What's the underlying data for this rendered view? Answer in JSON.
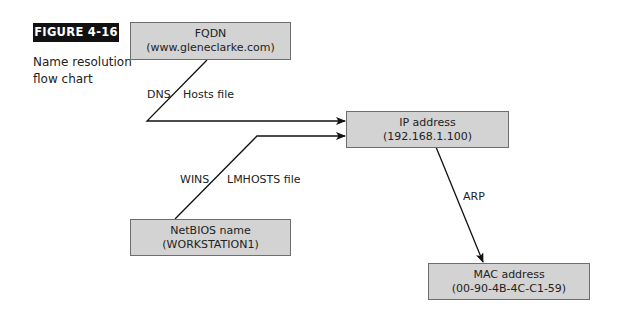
{
  "figure": {
    "label": "FIGURE 4-16",
    "caption_line1": "Name resolution",
    "caption_line2": "flow chart"
  },
  "nodes": {
    "fqdn": {
      "title": "FQDN",
      "value": "(www.gleneclarke.com)"
    },
    "ip": {
      "title": "IP address",
      "value": "(192.168.1.100)"
    },
    "netbios": {
      "title": "NetBIOS name",
      "value": "(WORKSTATION1)"
    },
    "mac": {
      "title": "MAC address",
      "value": "(00-90-4B-4C-C1-59)"
    }
  },
  "edges": {
    "fqdn_to_ip": {
      "left_label": "DNS",
      "right_label": "Hosts file"
    },
    "netbios_to_ip": {
      "left_label": "WINS",
      "right_label": "LMHOSTS file"
    },
    "ip_to_mac": {
      "label": "ARP"
    }
  },
  "colors": {
    "node_fill": "#d3d3d3",
    "node_border": "#6e6e6e",
    "line": "#111111",
    "badge_bg": "#111111"
  }
}
